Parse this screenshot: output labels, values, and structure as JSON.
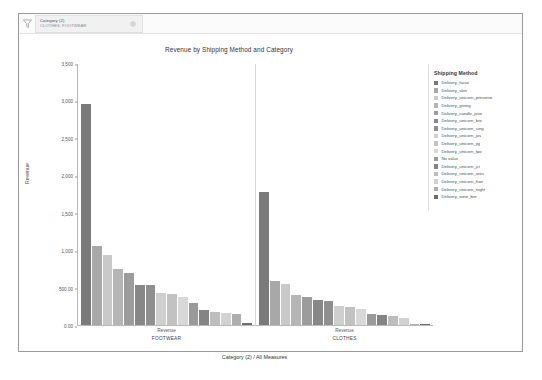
{
  "window": {
    "filter_bar": {
      "funnel_icon": "funnel-icon",
      "gear_icon": "gear-icon",
      "chip_title": "Category (2)",
      "chip_sub": "CLOTHES, FOOTWEAR"
    }
  },
  "chart_data": {
    "type": "bar",
    "title": "Revenue by Shipping Method and Category",
    "xlabel": "Category (2) / All Measures",
    "ylabel": "Revenue",
    "ylim": [
      0,
      3500
    ],
    "grid": false,
    "legend_position": "right",
    "legend_title": "Shipping Method",
    "measure_label": "Revenue",
    "yticks": [
      "0.00",
      "500.00",
      "1,000",
      "1,500",
      "2,000",
      "2,500",
      "3,000",
      "3,500"
    ],
    "ytick_values": [
      0,
      500,
      1000,
      1500,
      2000,
      2500,
      3000,
      3500
    ],
    "categories": [
      "FOOTWEAR",
      "CLOTHES"
    ],
    "series_names": [
      "Delivery_facial",
      "Delivery_skin",
      "Delivery_unicorn_preserve",
      "Delivery_giving",
      "Delivery_candle_jove",
      "Delivery_unicorn_bre",
      "Delivery_unicorn_sing",
      "Delivery_unicorn_jov",
      "Delivery_unicorn_jig",
      "Delivery_unicorn_fpo",
      "No value",
      "Delivery_unicorn_jct",
      "Delivery_unicorn_ares",
      "Delivery_unicorn_han",
      "Delivery_unicorn_night",
      "Delivery_wine_bre"
    ],
    "panels": [
      {
        "name": "FOOTWEAR",
        "values": [
          2950,
          1060,
          930,
          745,
          690,
          540,
          535,
          430,
          415,
          375,
          300,
          205,
          170,
          160,
          150,
          30
        ]
      },
      {
        "name": "CLOTHES",
        "values": [
          1780,
          590,
          545,
          400,
          370,
          330,
          325,
          250,
          240,
          215,
          145,
          130,
          115,
          100,
          20,
          12
        ]
      }
    ],
    "colors": [
      "#7a7a7a",
      "#a8a8a8",
      "#c9c9c9",
      "#b5b5b5",
      "#9c9c9c",
      "#878787",
      "#8f8f8f",
      "#cfcfcf",
      "#c2c2c2",
      "#d8d8d8",
      "#9a9a9a",
      "#848484",
      "#bdbdbd",
      "#d2d2d2",
      "#aeaeae",
      "#6f6f6f"
    ]
  }
}
